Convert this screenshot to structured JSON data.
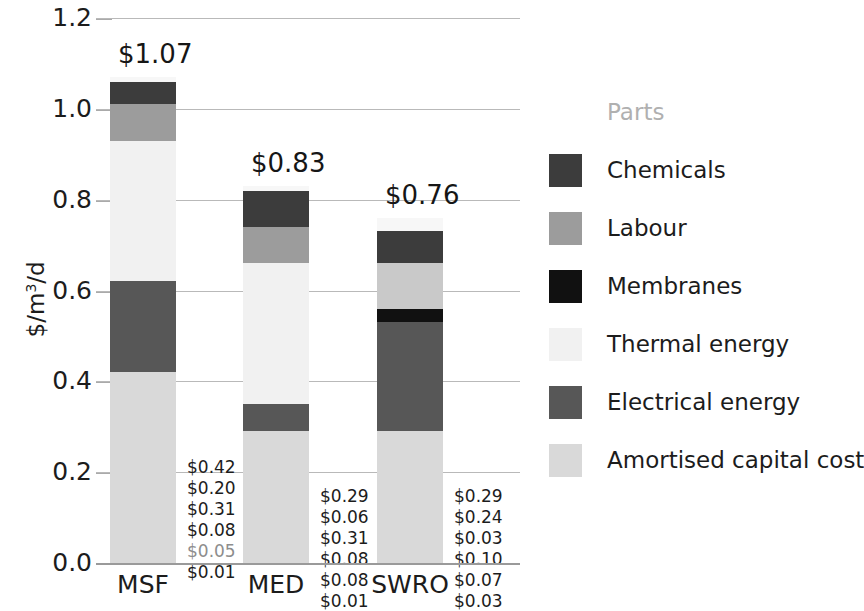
{
  "chart_data": {
    "type": "bar",
    "subtype": "stacked",
    "title": "",
    "xlabel": "",
    "ylabel": "$/m3/d",
    "ylabel_display": "$/m³/d",
    "ylim": [
      0.0,
      1.2
    ],
    "ytick_labels": [
      "0.0",
      "0.2",
      "0.4",
      "0.6",
      "0.8",
      "1.0",
      "1.2"
    ],
    "ytick_values": [
      0.0,
      0.2,
      0.4,
      0.6,
      0.8,
      1.0,
      1.2
    ],
    "grid": true,
    "legend_position": "right",
    "categories": [
      "MSF",
      "MED",
      "SWRO"
    ],
    "totals": [
      1.07,
      0.83,
      0.76
    ],
    "total_labels": [
      "$1.07",
      "$0.83",
      "$0.76"
    ],
    "series": [
      {
        "name": "Amortised capital cost",
        "color": "#d9d9d9",
        "values": [
          0.42,
          0.29,
          0.29
        ],
        "labels": [
          "$0.42",
          "$0.29",
          "$0.29"
        ]
      },
      {
        "name": "Electrical energy",
        "color": "#575757",
        "values": [
          0.2,
          0.06,
          0.24
        ],
        "labels": [
          "$0.20",
          "$0.06",
          "$0.24"
        ]
      },
      {
        "name": "Thermal energy",
        "color": "#f1f1f1",
        "values": [
          0.31,
          0.31,
          0.0
        ],
        "labels": [
          "$0.31",
          "$0.31",
          ""
        ]
      },
      {
        "name": "Membranes",
        "color": "#111111",
        "values": [
          0.0,
          0.0,
          0.03
        ],
        "labels": [
          "",
          "",
          "$0.03"
        ]
      },
      {
        "name": "Labour",
        "color": "#9c9c9c",
        "values": [
          0.08,
          0.08,
          0.1
        ],
        "labels": [
          "$0.08",
          "$0.08",
          "$0.10"
        ]
      },
      {
        "name": "Chemicals",
        "color": "#3c3c3c",
        "values": [
          0.05,
          0.08,
          0.07
        ],
        "labels": [
          "$0.05",
          "$0.08",
          "$0.07"
        ]
      },
      {
        "name": "Parts",
        "color": "#f7f7f7",
        "values": [
          0.01,
          0.01,
          0.03
        ],
        "labels": [
          "$0.01",
          "$0.01",
          "$0.03"
        ]
      }
    ]
  },
  "axes": {
    "y_title": "$/m³/d",
    "y_title_prefix": "$/m",
    "y_title_sup": "3",
    "y_title_suffix": "/d",
    "yticks": [
      "1.2",
      "1.0",
      "0.8",
      "0.6",
      "0.4",
      "0.2",
      "0.0"
    ],
    "xticks": [
      "MSF",
      "MED",
      "SWRO"
    ]
  },
  "bars": [
    {
      "name": "MSF",
      "total_label": "$1.07",
      "segments": [
        {
          "series": "Parts",
          "label": "$0.01",
          "value": 0.01,
          "color": "#f7f7f7",
          "faded": false
        },
        {
          "series": "Chemicals",
          "label": "$0.05",
          "value": 0.05,
          "color": "#3c3c3c",
          "faded": true
        },
        {
          "series": "Labour",
          "label": "$0.08",
          "value": 0.08,
          "color": "#9c9c9c",
          "faded": false
        },
        {
          "series": "Thermal energy",
          "label": "$0.31",
          "value": 0.31,
          "color": "#f1f1f1",
          "faded": false
        },
        {
          "series": "Electrical energy",
          "label": "$0.20",
          "value": 0.2,
          "color": "#575757",
          "faded": false
        },
        {
          "series": "Amortised capital cost",
          "label": "$0.42",
          "value": 0.42,
          "color": "#d9d9d9",
          "faded": false
        }
      ]
    },
    {
      "name": "MED",
      "total_label": "$0.83",
      "segments": [
        {
          "series": "Parts",
          "label": "$0.01",
          "value": 0.01,
          "color": "#f7f7f7",
          "faded": false
        },
        {
          "series": "Chemicals",
          "label": "$0.08",
          "value": 0.08,
          "color": "#3c3c3c",
          "faded": false
        },
        {
          "series": "Labour",
          "label": "$0.08",
          "value": 0.08,
          "color": "#9c9c9c",
          "faded": false
        },
        {
          "series": "Thermal energy",
          "label": "$0.31",
          "value": 0.31,
          "color": "#f1f1f1",
          "faded": false
        },
        {
          "series": "Electrical energy",
          "label": "$0.06",
          "value": 0.06,
          "color": "#575757",
          "faded": false
        },
        {
          "series": "Amortised capital cost",
          "label": "$0.29",
          "value": 0.29,
          "color": "#d9d9d9",
          "faded": false
        }
      ]
    },
    {
      "name": "SWRO",
      "total_label": "$0.76",
      "segments": [
        {
          "series": "Parts",
          "label": "$0.03",
          "value": 0.03,
          "color": "#f7f7f7",
          "faded": false
        },
        {
          "series": "Chemicals",
          "label": "$0.07",
          "value": 0.07,
          "color": "#3c3c3c",
          "faded": false
        },
        {
          "series": "Labour",
          "label": "$0.10",
          "value": 0.1,
          "color": "#c9c9c9",
          "faded": false
        },
        {
          "series": "Membranes",
          "label": "$0.03",
          "value": 0.03,
          "color": "#111111",
          "faded": false
        },
        {
          "series": "Electrical energy",
          "label": "$0.24",
          "value": 0.24,
          "color": "#575757",
          "faded": false
        },
        {
          "series": "Amortised capital cost",
          "label": "$0.29",
          "value": 0.29,
          "color": "#d9d9d9",
          "faded": false
        }
      ]
    }
  ],
  "legend": {
    "items": [
      {
        "label": "Parts",
        "color": "#f7f7f7",
        "ghost": true
      },
      {
        "label": "Chemicals",
        "color": "#3c3c3c",
        "ghost": false
      },
      {
        "label": "Labour",
        "color": "#9c9c9c",
        "ghost": false
      },
      {
        "label": "Membranes",
        "color": "#111111",
        "ghost": false
      },
      {
        "label": "Thermal energy",
        "color": "#f1f1f1",
        "ghost": false
      },
      {
        "label": "Electrical energy",
        "color": "#575757",
        "ghost": false
      },
      {
        "label": "Amortised capital cost",
        "color": "#d9d9d9",
        "ghost": false
      }
    ]
  }
}
